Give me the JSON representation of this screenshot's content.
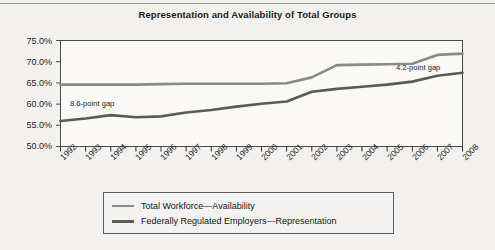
{
  "chart_data": {
    "type": "line",
    "title": "Representation and Availability of Total Groups",
    "xlabel": "",
    "ylabel": "",
    "ylim": [
      50,
      75
    ],
    "ytick_labels": [
      "75.0%",
      "70.0%",
      "65.0%",
      "60.0%",
      "55.0%",
      "50.0%"
    ],
    "yticks": [
      75,
      70,
      65,
      60,
      55,
      50
    ],
    "grid": false,
    "legend_position": "bottom",
    "categories": [
      "1992",
      "1993",
      "1994",
      "1995",
      "1996",
      "1997",
      "1998",
      "1999",
      "2000",
      "2001",
      "2002",
      "2003",
      "2004",
      "2005",
      "2006",
      "2007",
      "2008"
    ],
    "series": [
      {
        "name": "Total Workforce—Availability",
        "color": "#8a8a88",
        "values": [
          64.6,
          64.6,
          64.6,
          64.6,
          64.7,
          64.8,
          64.8,
          64.8,
          64.8,
          64.9,
          66.3,
          69.2,
          69.3,
          69.4,
          69.5,
          71.6,
          71.9
        ]
      },
      {
        "name": "Federally Regulated Employers—Representation",
        "color": "#5a5a58",
        "values": [
          56.0,
          56.6,
          57.4,
          56.9,
          57.1,
          58.0,
          58.6,
          59.4,
          60.1,
          60.6,
          62.9,
          63.6,
          64.1,
          64.6,
          65.3,
          66.7,
          67.4
        ]
      }
    ],
    "annotations": [
      {
        "text": "8.6-point gap",
        "x_category": "1993",
        "value": 60.0
      },
      {
        "text": "4.2-point gap",
        "x_category": "2006",
        "value": 67.5
      }
    ]
  },
  "legend": {
    "items": [
      {
        "label": "Total Workforce—Availability"
      },
      {
        "label": "Federally Regulated Employers—Representation"
      }
    ]
  }
}
